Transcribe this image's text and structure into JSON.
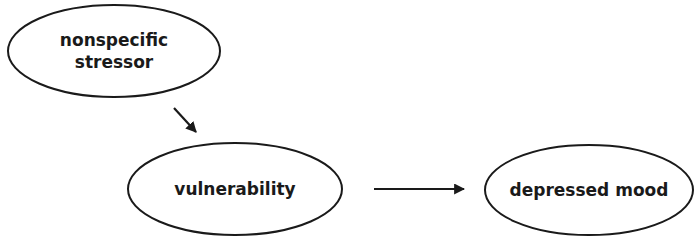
{
  "diagram": {
    "type": "causal-flow",
    "nodes": [
      {
        "id": "stressor",
        "label_line1": "nonspecific",
        "label_line2": "stressor",
        "cx": 114,
        "cy": 51,
        "rx": 106,
        "ry": 46
      },
      {
        "id": "vulnerability",
        "label": "vulnerability",
        "cx": 235,
        "cy": 189,
        "rx": 107,
        "ry": 46
      },
      {
        "id": "depressed_mood",
        "label": "depressed mood",
        "cx": 589,
        "cy": 190,
        "rx": 104,
        "ry": 45
      }
    ],
    "edges": [
      {
        "from": "stressor",
        "to": "vulnerability",
        "direction": "diagonal-down-right"
      },
      {
        "from": "vulnerability",
        "to": "depressed_mood",
        "direction": "right"
      }
    ],
    "colors": {
      "stroke": "#1a1a1a",
      "fill": "#ffffff",
      "text": "#1a1a1a"
    }
  }
}
